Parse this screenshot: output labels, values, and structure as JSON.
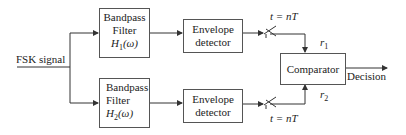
{
  "input": {
    "label": "FSK signal"
  },
  "branch1": {
    "filter": {
      "line1": "Bandpass",
      "line2": "Filter",
      "transfer": "H",
      "sub": "1",
      "arg": "(ω)"
    },
    "detector": {
      "line1": "Envelope",
      "line2": "detector"
    },
    "sampler": {
      "label": "t = nT"
    },
    "output": {
      "symbol": "r",
      "sub": "1"
    }
  },
  "branch2": {
    "filter": {
      "line1": "Bandpass",
      "line2": "Filter",
      "transfer": "H",
      "sub": "2",
      "arg": "(ω)"
    },
    "detector": {
      "line1": "Envelope",
      "line2": "detector"
    },
    "sampler": {
      "label": "t = nT"
    },
    "output": {
      "symbol": "r",
      "sub": "2"
    }
  },
  "comparator": {
    "label": "Comparator"
  },
  "output": {
    "label": "Decision"
  },
  "colors": {
    "line": "#333333",
    "box_border": "#555555"
  }
}
